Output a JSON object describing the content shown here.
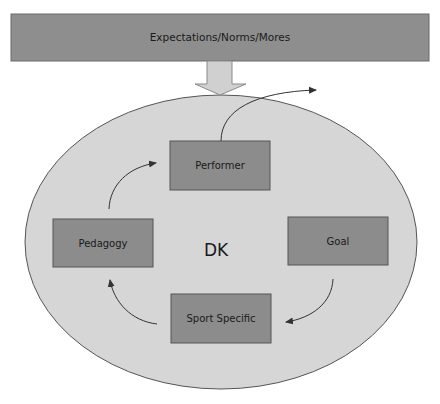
{
  "diagram": {
    "header_bar": {
      "label": "Expectations/Norms/Mores"
    },
    "center_label": "DK",
    "nodes": [
      {
        "id": "performer",
        "label": "Performer"
      },
      {
        "id": "goal",
        "label": "Goal"
      },
      {
        "id": "sport_specific",
        "label": "Sport Specific"
      },
      {
        "id": "pedagogy",
        "label": "Pedagogy"
      }
    ],
    "edges": [
      {
        "from": "expectations",
        "to": "dk_ellipse",
        "style": "block-arrow"
      },
      {
        "from": "performer",
        "to": "outside",
        "style": "curved-arrow"
      },
      {
        "from": "goal",
        "to": "sport_specific",
        "style": "curved-arrow"
      },
      {
        "from": "sport_specific",
        "to": "pedagogy",
        "style": "curved-arrow"
      },
      {
        "from": "pedagogy",
        "to": "performer",
        "style": "curved-arrow"
      }
    ],
    "colors": {
      "bar_fill": "#8e8e8e",
      "box_fill": "#8c8c8c",
      "ellipse_fill": "#d6d6d6",
      "arrow_fill": "#d0d0d0",
      "stroke": "#555555"
    }
  }
}
